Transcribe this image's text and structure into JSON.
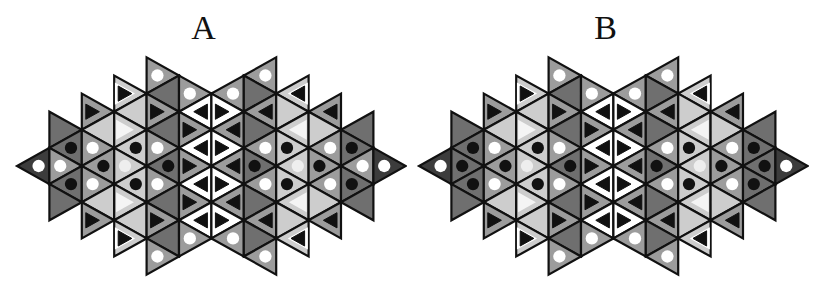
{
  "geometry": {
    "tip_x": 17,
    "col_spacing": 32.4,
    "center_y": 166,
    "half_side": 18.1,
    "num_cols": 13
  },
  "colors": {
    "K": "#3c3c3c",
    "D": "#6f6f6f",
    "M": "#9c9c9c",
    "L": "#cdcdcd",
    "W": "#ffffff",
    "stroke": "#111111",
    "white_dot": "#ffffff",
    "black_dot": "#111111",
    "inner_tri": "#111111",
    "light_tri": "#f4f4f4"
  },
  "panels": [
    {
      "label": "A",
      "offset_x": 0,
      "strips": [
        [
          {
            "m": 0,
            "f": "K",
            "g": "w"
          }
        ],
        [
          {
            "m": -2,
            "f": "D",
            "g": "n"
          },
          {
            "m": -1,
            "f": "D",
            "g": "b"
          },
          {
            "m": 0,
            "f": "M",
            "g": "w"
          },
          {
            "m": 1,
            "f": "D",
            "g": "b"
          },
          {
            "m": 2,
            "f": "D",
            "g": "n"
          }
        ],
        [
          {
            "m": -3,
            "f": "M",
            "g": "t"
          },
          {
            "m": -2,
            "f": "L",
            "g": "n"
          },
          {
            "m": -1,
            "f": "M",
            "g": "w"
          },
          {
            "m": 0,
            "f": "M",
            "g": "b"
          },
          {
            "m": 1,
            "f": "M",
            "g": "w"
          },
          {
            "m": 2,
            "f": "L",
            "g": "n"
          },
          {
            "m": 3,
            "f": "M",
            "g": "t"
          }
        ],
        [
          {
            "m": -4,
            "f": "L",
            "g": "t"
          },
          {
            "m": -3,
            "f": "L",
            "g": "n"
          },
          {
            "m": -2,
            "f": "L",
            "g": "v"
          },
          {
            "m": -1,
            "f": "L",
            "g": "b"
          },
          {
            "m": 0,
            "f": "L",
            "g": "lw"
          },
          {
            "m": 1,
            "f": "L",
            "g": "b"
          },
          {
            "m": 2,
            "f": "L",
            "g": "v"
          },
          {
            "m": 3,
            "f": "L",
            "g": "n"
          },
          {
            "m": 4,
            "f": "L",
            "g": "t"
          }
        ],
        [
          {
            "m": -5,
            "f": "M",
            "g": "w"
          },
          {
            "m": -4,
            "f": "D",
            "g": "n"
          },
          {
            "m": -3,
            "f": "M",
            "g": "t"
          },
          {
            "m": -2,
            "f": "D",
            "g": "n"
          },
          {
            "m": -1,
            "f": "M",
            "g": "w"
          },
          {
            "m": 0,
            "f": "D",
            "g": "b"
          },
          {
            "m": 1,
            "f": "M",
            "g": "w"
          },
          {
            "m": 2,
            "f": "D",
            "g": "n"
          },
          {
            "m": 3,
            "f": "M",
            "g": "t"
          },
          {
            "m": 4,
            "f": "D",
            "g": "n"
          },
          {
            "m": 5,
            "f": "M",
            "g": "w"
          }
        ],
        [
          {
            "m": -4,
            "f": "M",
            "g": "w"
          },
          {
            "m": -3,
            "f": "W",
            "g": "t"
          },
          {
            "m": -2,
            "f": "M",
            "g": "t"
          },
          {
            "m": -1,
            "f": "W",
            "g": "t"
          },
          {
            "m": 0,
            "f": "M",
            "g": "t"
          },
          {
            "m": 1,
            "f": "W",
            "g": "t"
          },
          {
            "m": 2,
            "f": "M",
            "g": "t"
          },
          {
            "m": 3,
            "f": "W",
            "g": "t"
          },
          {
            "m": 4,
            "f": "M",
            "g": "w"
          }
        ]
      ]
    },
    {
      "label": "B",
      "offset_x": 402,
      "strips": [
        [
          {
            "m": 0,
            "f": "K",
            "g": "w"
          }
        ],
        [
          {
            "m": -2,
            "f": "D",
            "g": "n"
          },
          {
            "m": -1,
            "f": "D",
            "g": "b"
          },
          {
            "m": 0,
            "f": "D",
            "g": "b"
          },
          {
            "m": 1,
            "f": "D",
            "g": "b"
          },
          {
            "m": 2,
            "f": "D",
            "g": "n"
          }
        ],
        [
          {
            "m": -3,
            "f": "M",
            "g": "t"
          },
          {
            "m": -2,
            "f": "L",
            "g": "n"
          },
          {
            "m": -1,
            "f": "M",
            "g": "w"
          },
          {
            "m": 0,
            "f": "M",
            "g": "b"
          },
          {
            "m": 1,
            "f": "M",
            "g": "w"
          },
          {
            "m": 2,
            "f": "L",
            "g": "n"
          },
          {
            "m": 3,
            "f": "M",
            "g": "t"
          }
        ],
        [
          {
            "m": -4,
            "f": "L",
            "g": "t"
          },
          {
            "m": -3,
            "f": "L",
            "g": "n"
          },
          {
            "m": -2,
            "f": "L",
            "g": "v"
          },
          {
            "m": -1,
            "f": "L",
            "g": "b"
          },
          {
            "m": 0,
            "f": "L",
            "g": "lw"
          },
          {
            "m": 1,
            "f": "L",
            "g": "b"
          },
          {
            "m": 2,
            "f": "L",
            "g": "v"
          },
          {
            "m": 3,
            "f": "L",
            "g": "n"
          },
          {
            "m": 4,
            "f": "L",
            "g": "t"
          }
        ],
        [
          {
            "m": -5,
            "f": "M",
            "g": "w"
          },
          {
            "m": -4,
            "f": "D",
            "g": "n"
          },
          {
            "m": -3,
            "f": "M",
            "g": "t"
          },
          {
            "m": -2,
            "f": "D",
            "g": "n"
          },
          {
            "m": -1,
            "f": "M",
            "g": "w"
          },
          {
            "m": 0,
            "f": "D",
            "g": "b"
          },
          {
            "m": 1,
            "f": "M",
            "g": "w"
          },
          {
            "m": 2,
            "f": "D",
            "g": "n"
          },
          {
            "m": 3,
            "f": "M",
            "g": "t"
          },
          {
            "m": 4,
            "f": "D",
            "g": "n"
          },
          {
            "m": 5,
            "f": "M",
            "g": "w"
          }
        ],
        [
          {
            "m": -4,
            "f": "M",
            "g": "w"
          },
          {
            "m": -3,
            "f": "W",
            "g": "t"
          },
          {
            "m": -2,
            "f": "M",
            "g": "t"
          },
          {
            "m": -1,
            "f": "W",
            "g": "t"
          },
          {
            "m": 0,
            "f": "M",
            "g": "t"
          },
          {
            "m": 1,
            "f": "W",
            "g": "t"
          },
          {
            "m": 2,
            "f": "M",
            "g": "t"
          },
          {
            "m": 3,
            "f": "W",
            "g": "t"
          },
          {
            "m": 4,
            "f": "M",
            "g": "w"
          }
        ]
      ]
    }
  ]
}
